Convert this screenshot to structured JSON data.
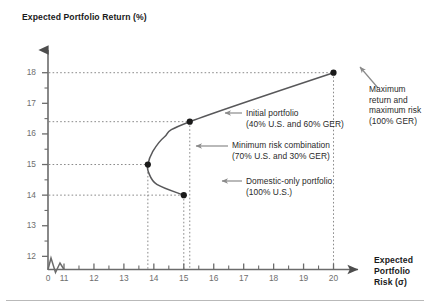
{
  "chart_data": {
    "type": "line",
    "title": "",
    "xlabel": "Expected Portfolio Risk (σ)",
    "ylabel": "Expected Portfolio Return (%)",
    "xlim": [
      10.5,
      20.8
    ],
    "ylim": [
      11.6,
      18.4
    ],
    "grid": false,
    "legend_position": "none",
    "x_ticks": [
      "0",
      "11",
      "12",
      "13",
      "14",
      "15",
      "16",
      "17",
      "18",
      "19",
      "20"
    ],
    "y_ticks": [
      "12",
      "13",
      "14",
      "15",
      "16",
      "17",
      "18"
    ],
    "x_axis_break": true,
    "series": [
      {
        "name": "Efficient frontier",
        "points": [
          {
            "x": 15.0,
            "y": 14.0
          },
          {
            "x": 14.1,
            "y": 14.35
          },
          {
            "x": 13.82,
            "y": 14.75
          },
          {
            "x": 13.8,
            "y": 15.0
          },
          {
            "x": 13.95,
            "y": 15.4
          },
          {
            "x": 14.35,
            "y": 15.9
          },
          {
            "x": 15.2,
            "y": 16.4
          },
          {
            "x": 20.0,
            "y": 18.0
          }
        ]
      }
    ],
    "markers": [
      {
        "label": "domestic-only",
        "x": 15.0,
        "y": 14.0
      },
      {
        "label": "minimum-risk",
        "x": 13.8,
        "y": 15.0
      },
      {
        "label": "initial",
        "x": 15.2,
        "y": 16.4
      },
      {
        "label": "maximum",
        "x": 20.0,
        "y": 18.0
      }
    ],
    "annotations": [
      {
        "name": "initial-portfolio",
        "text": "Initial portfolio\n(40% U.S. and 60% GER)",
        "target_x": 15.2,
        "target_y": 16.4
      },
      {
        "name": "minimum-risk-combination",
        "text": "Minimum risk combination\n(70% U.S. and 30% GER)",
        "target_x": 13.8,
        "target_y": 15.0
      },
      {
        "name": "domestic-only-portfolio",
        "text": "Domestic-only portfolio\n(100% U.S.)",
        "target_x": 15.0,
        "target_y": 14.0
      },
      {
        "name": "maximum-return-risk",
        "text": "Maximum\nreturn and\nmaximum risk\n(100% GER)",
        "target_x": 20.0,
        "target_y": 18.0
      }
    ],
    "guide_values": {
      "horizontal_y": [
        18,
        16.4,
        15,
        14
      ],
      "vertical_x": [
        13.8,
        15.0,
        15.2,
        20.0
      ]
    },
    "colors": {
      "axis": "#6b6b6b",
      "curve": "#58585a",
      "marker": "#1a1a1a",
      "guide": "#8a8a8a",
      "arrow": "#8a8a8a",
      "text": "#2a2a2a",
      "tick_text": "#6e6e6e",
      "rule": "#b9b9b9"
    }
  }
}
